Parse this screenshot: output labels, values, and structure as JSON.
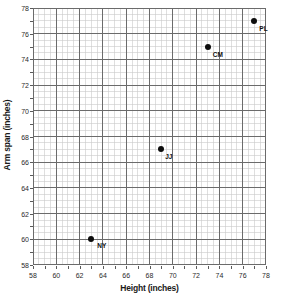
{
  "chart_data": {
    "type": "scatter",
    "title": "",
    "xlabel": "Height (inches)",
    "ylabel": "Arm span (inches)",
    "xlim": [
      58,
      78
    ],
    "ylim": [
      58,
      78
    ],
    "x_major_step": 2,
    "y_major_step": 2,
    "x_minor_step": 0.5,
    "y_minor_step": 0.5,
    "grid": true,
    "legend": "none",
    "x_tick_labels": [
      "58",
      "60",
      "62",
      "64",
      "66",
      "68",
      "70",
      "72",
      "74",
      "76",
      "78"
    ],
    "y_tick_labels": [
      "78",
      "76",
      "74",
      "72",
      "70",
      "68",
      "66",
      "64",
      "62",
      "60",
      "58"
    ],
    "x_ticks": [
      58,
      60,
      62,
      64,
      66,
      68,
      70,
      72,
      74,
      76,
      78
    ],
    "y_ticks": [
      78,
      76,
      74,
      72,
      70,
      68,
      66,
      64,
      62,
      60,
      58
    ],
    "points": [
      {
        "label": "NY",
        "x": 63,
        "y": 60,
        "label_dx": 6,
        "label_dy": 4
      },
      {
        "label": "JJ",
        "x": 69,
        "y": 67,
        "label_dx": 4,
        "label_dy": 5
      },
      {
        "label": "CM",
        "x": 73,
        "y": 75,
        "label_dx": 5,
        "label_dy": 5
      },
      {
        "label": "PL",
        "x": 77,
        "y": 77,
        "label_dx": 5,
        "label_dy": 5
      }
    ]
  },
  "colors": {
    "point": "#0d0d0d",
    "major_grid": "#6b6b6b",
    "minor_grid": "#c9c9c9",
    "axis": "#5a5a5a",
    "text": "#2b2b2b",
    "background": "#ffffff"
  },
  "axes": {
    "x_title": "Height (inches)",
    "y_title": "Arm span (inches)"
  }
}
